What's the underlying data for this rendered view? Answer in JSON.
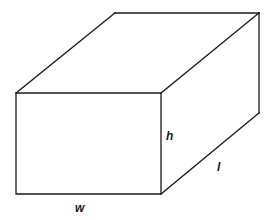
{
  "diagram": {
    "type": "rectangular-box-3d",
    "stroke_color": "#1a1a1a",
    "background_color": "#ffffff",
    "vertices": {
      "front_top_left": [
        16,
        93
      ],
      "front_top_right": [
        161,
        93
      ],
      "front_bottom_left": [
        16,
        194
      ],
      "front_bottom_right": [
        161,
        194
      ],
      "back_top_left": [
        115,
        13
      ],
      "back_top_right": [
        259,
        13
      ],
      "back_bottom_right": [
        259,
        113
      ]
    },
    "labels": {
      "height": "h",
      "length": "l",
      "width": "w"
    }
  }
}
